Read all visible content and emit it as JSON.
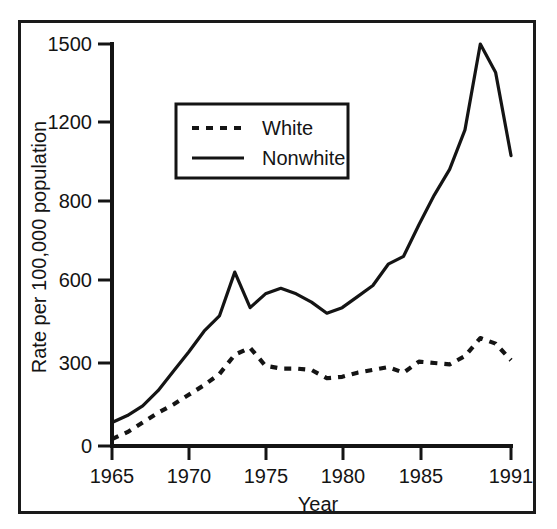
{
  "figure": {
    "frame_border_color": "#1a1a1a",
    "background_color": "#ffffff",
    "ink_color": "#141414",
    "cropped_header_text": ""
  },
  "chart_data": {
    "type": "line",
    "title": "",
    "xlabel": "Year",
    "ylabel": "Rate per 100,000 population",
    "xlim": [
      1965,
      1991
    ],
    "ylim": [
      0,
      1500
    ],
    "grid": false,
    "legend_position": "upper-left-inside",
    "xticks": [
      1965,
      1970,
      1975,
      1980,
      1985,
      1991
    ],
    "xtick_labels": [
      "1965",
      "1970",
      "1975",
      "1980",
      "1985",
      "1991"
    ],
    "yticks": [
      0,
      300,
      600,
      800,
      1200,
      1500
    ],
    "ytick_labels": [
      "0",
      "300",
      "600",
      "800",
      "1200",
      "1500"
    ],
    "y_axis_note": "broken axis: labeled ticks are equally spaced",
    "x": [
      1965,
      1966,
      1967,
      1968,
      1969,
      1970,
      1971,
      1972,
      1973,
      1974,
      1975,
      1976,
      1977,
      1978,
      1979,
      1980,
      1981,
      1982,
      1983,
      1984,
      1985,
      1986,
      1987,
      1988,
      1989,
      1990,
      1991
    ],
    "series": [
      {
        "name": "White",
        "style": "dashed",
        "color": "#141414",
        "values": [
          25,
          50,
          85,
          120,
          150,
          185,
          220,
          260,
          330,
          355,
          290,
          280,
          280,
          275,
          245,
          250,
          265,
          275,
          285,
          265,
          305,
          300,
          295,
          325,
          390,
          370,
          310
        ]
      },
      {
        "name": "Nonwhite",
        "style": "solid",
        "color": "#141414",
        "values": [
          85,
          110,
          145,
          200,
          270,
          340,
          415,
          470,
          620,
          500,
          550,
          570,
          550,
          520,
          480,
          500,
          540,
          580,
          640,
          660,
          740,
          830,
          960,
          1160,
          1500,
          1390,
          1030
        ]
      }
    ],
    "legend_entries": [
      "White",
      "Nonwhite"
    ]
  }
}
